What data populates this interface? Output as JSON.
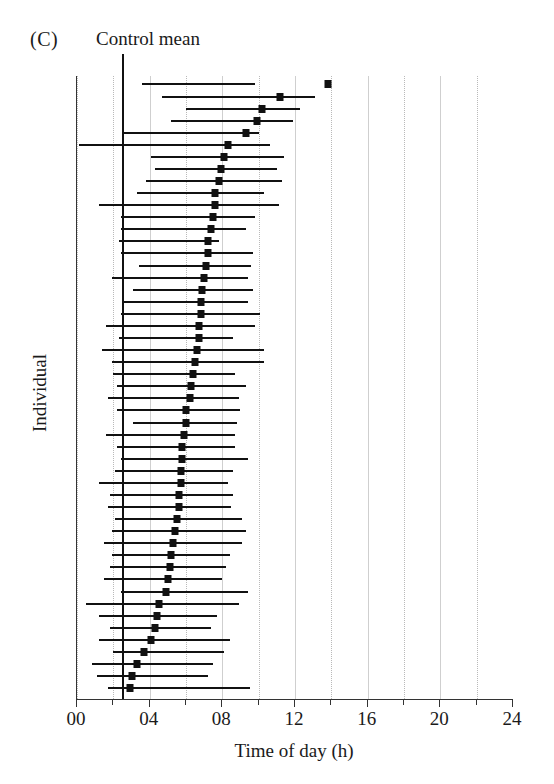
{
  "figure": {
    "panel_label": "(C)",
    "annotation_label": "Control mean"
  },
  "chart_data": {
    "type": "line",
    "title": "",
    "subtitle": "",
    "xlabel": "Time of day (h)",
    "ylabel": "Individual",
    "xlim": [
      0,
      24
    ],
    "ylim": [
      0,
      50
    ],
    "grid": true,
    "grid_axis": "x",
    "grid_interval_h": 2,
    "legend": "none",
    "xticks": [
      0,
      4,
      8,
      12,
      16,
      20,
      24
    ],
    "xticklabels": [
      "00",
      "04",
      "08",
      "12",
      "16",
      "20",
      "24"
    ],
    "minor_gridlines_h": [
      2,
      6,
      10,
      14,
      18,
      22
    ],
    "annotations": [
      {
        "name": "control-mean",
        "label": "Control mean",
        "type": "vline",
        "x": 2.5
      }
    ],
    "series_description": "Per-individual onset time estimate (filled square) with horizontal range bar, sorted by estimate; 50 individuals.",
    "point_label": "estimate",
    "bar_label": "range",
    "rows": [
      {
        "i": 1,
        "estimate": 13.8,
        "low": 3.6,
        "high": 9.8
      },
      {
        "i": 2,
        "estimate": 11.2,
        "low": 4.7,
        "high": 13.1
      },
      {
        "i": 3,
        "estimate": 10.2,
        "low": 6.0,
        "high": 12.3
      },
      {
        "i": 4,
        "estimate": 9.9,
        "low": 5.2,
        "high": 11.9
      },
      {
        "i": 5,
        "estimate": 9.3,
        "low": 2.6,
        "high": 10.0
      },
      {
        "i": 6,
        "estimate": 8.3,
        "low": 0.1,
        "high": 10.6
      },
      {
        "i": 7,
        "estimate": 8.1,
        "low": 4.1,
        "high": 11.4
      },
      {
        "i": 8,
        "estimate": 7.9,
        "low": 4.3,
        "high": 11.0
      },
      {
        "i": 9,
        "estimate": 7.8,
        "low": 3.8,
        "high": 11.3
      },
      {
        "i": 10,
        "estimate": 7.6,
        "low": 3.3,
        "high": 10.3
      },
      {
        "i": 11,
        "estimate": 7.6,
        "low": 1.2,
        "high": 11.1
      },
      {
        "i": 12,
        "estimate": 7.5,
        "low": 2.4,
        "high": 9.8
      },
      {
        "i": 13,
        "estimate": 7.4,
        "low": 2.4,
        "high": 9.3
      },
      {
        "i": 14,
        "estimate": 7.2,
        "low": 2.3,
        "high": 7.8
      },
      {
        "i": 15,
        "estimate": 7.2,
        "low": 2.4,
        "high": 9.7
      },
      {
        "i": 16,
        "estimate": 7.1,
        "low": 3.4,
        "high": 9.6
      },
      {
        "i": 17,
        "estimate": 7.0,
        "low": 1.9,
        "high": 9.4
      },
      {
        "i": 18,
        "estimate": 6.9,
        "low": 3.1,
        "high": 9.7
      },
      {
        "i": 19,
        "estimate": 6.8,
        "low": 2.6,
        "high": 9.4
      },
      {
        "i": 20,
        "estimate": 6.8,
        "low": 2.4,
        "high": 10.1
      },
      {
        "i": 21,
        "estimate": 6.7,
        "low": 1.6,
        "high": 9.8
      },
      {
        "i": 22,
        "estimate": 6.7,
        "low": 2.3,
        "high": 8.6
      },
      {
        "i": 23,
        "estimate": 6.6,
        "low": 1.4,
        "high": 10.3
      },
      {
        "i": 24,
        "estimate": 6.5,
        "low": 1.9,
        "high": 10.3
      },
      {
        "i": 25,
        "estimate": 6.4,
        "low": 2.0,
        "high": 8.7
      },
      {
        "i": 26,
        "estimate": 6.3,
        "low": 2.2,
        "high": 9.3
      },
      {
        "i": 27,
        "estimate": 6.2,
        "low": 1.7,
        "high": 8.9
      },
      {
        "i": 28,
        "estimate": 6.0,
        "low": 2.2,
        "high": 9.0
      },
      {
        "i": 29,
        "estimate": 6.0,
        "low": 3.1,
        "high": 8.8
      },
      {
        "i": 30,
        "estimate": 5.9,
        "low": 1.6,
        "high": 8.7
      },
      {
        "i": 31,
        "estimate": 5.8,
        "low": 2.2,
        "high": 8.7
      },
      {
        "i": 32,
        "estimate": 5.8,
        "low": 2.4,
        "high": 9.4
      },
      {
        "i": 33,
        "estimate": 5.7,
        "low": 2.1,
        "high": 8.6
      },
      {
        "i": 34,
        "estimate": 5.7,
        "low": 1.2,
        "high": 8.3
      },
      {
        "i": 35,
        "estimate": 5.6,
        "low": 1.8,
        "high": 8.6
      },
      {
        "i": 36,
        "estimate": 5.6,
        "low": 1.7,
        "high": 8.5
      },
      {
        "i": 37,
        "estimate": 5.5,
        "low": 2.1,
        "high": 9.1
      },
      {
        "i": 38,
        "estimate": 5.4,
        "low": 1.9,
        "high": 9.3
      },
      {
        "i": 39,
        "estimate": 5.3,
        "low": 1.5,
        "high": 9.1
      },
      {
        "i": 40,
        "estimate": 5.2,
        "low": 1.9,
        "high": 8.4
      },
      {
        "i": 41,
        "estimate": 5.1,
        "low": 1.8,
        "high": 8.2
      },
      {
        "i": 42,
        "estimate": 5.0,
        "low": 1.5,
        "high": 8.0
      },
      {
        "i": 43,
        "estimate": 4.9,
        "low": 2.4,
        "high": 9.4
      },
      {
        "i": 44,
        "estimate": 4.5,
        "low": 0.5,
        "high": 8.9
      },
      {
        "i": 45,
        "estimate": 4.4,
        "low": 1.2,
        "high": 7.7
      },
      {
        "i": 46,
        "estimate": 4.3,
        "low": 1.8,
        "high": 7.4
      },
      {
        "i": 47,
        "estimate": 4.1,
        "low": 1.2,
        "high": 8.4
      },
      {
        "i": 48,
        "estimate": 3.7,
        "low": 2.0,
        "high": 8.1
      },
      {
        "i": 49,
        "estimate": 3.3,
        "low": 0.8,
        "high": 7.5
      },
      {
        "i": 50,
        "estimate": 3.0,
        "low": 1.1,
        "high": 7.2
      },
      {
        "i": 51,
        "estimate": 2.9,
        "low": 1.7,
        "high": 9.5
      }
    ]
  }
}
